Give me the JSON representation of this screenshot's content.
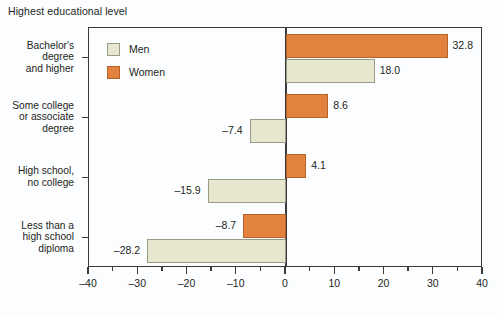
{
  "chart_data": {
    "type": "bar",
    "orientation": "horizontal",
    "title": "Highest educational level",
    "xlabel": "",
    "ylabel": "",
    "xlim": [
      -40,
      40
    ],
    "xticks": [
      -40,
      -30,
      -20,
      -10,
      0,
      10,
      20,
      30,
      40
    ],
    "xtick_labels": [
      "–40",
      "–30",
      "–20",
      "–10",
      "0",
      "10",
      "20",
      "30",
      "40"
    ],
    "minor_xticks": [
      -35,
      -25,
      -15,
      -5,
      5,
      15,
      25,
      35
    ],
    "grid": false,
    "legend_position": "top-left",
    "categories": [
      "Bachelor's degree and higher",
      "Some college or associate degree",
      "High school, no college",
      "Less than a high school diploma"
    ],
    "category_lines": [
      [
        "Bachelor's",
        "degree",
        "and higher"
      ],
      [
        "Some college",
        "or associate",
        "degree"
      ],
      [
        "High school,",
        "no college"
      ],
      [
        "Less than a",
        "high school",
        "diploma"
      ]
    ],
    "series": [
      {
        "name": "Men",
        "color": "#e6e7ce",
        "values": [
          18.0,
          -7.4,
          -15.9,
          -28.2
        ],
        "data_labels": [
          "18.0",
          "–7.4",
          "–15.9",
          "–28.2"
        ]
      },
      {
        "name": "Women",
        "color": "#e3823f",
        "values": [
          32.8,
          8.6,
          4.1,
          -8.7
        ],
        "data_labels": [
          "32.8",
          "8.6",
          "4.1",
          "–8.7"
        ]
      }
    ]
  },
  "legend": {
    "items": [
      {
        "label": "Men",
        "color": "#e6e7ce"
      },
      {
        "label": "Women",
        "color": "#e3823f"
      }
    ]
  },
  "axis": {
    "x_labels": [
      "–40",
      "–30",
      "–20",
      "–10",
      "0",
      "10",
      "20",
      "30",
      "40"
    ]
  },
  "colors": {
    "men": "#e6e7ce",
    "women": "#e3823f",
    "axis": "#3a3a3c",
    "text": "#231f20",
    "background": "#fcfdfe"
  }
}
